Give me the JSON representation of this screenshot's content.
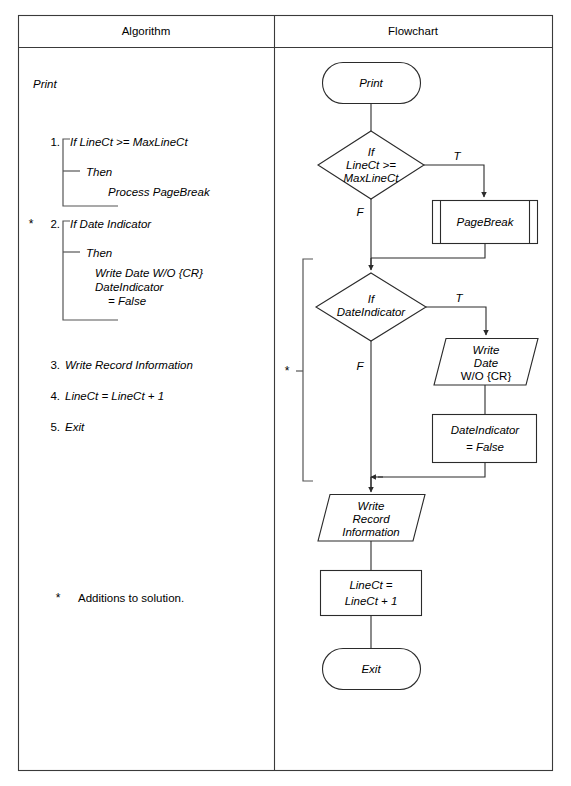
{
  "table": {
    "columns": [
      {
        "header": "Algorithm"
      },
      {
        "header": "Flowchart"
      }
    ]
  },
  "algorithm": {
    "title": "Print",
    "steps": [
      {
        "number": "1.",
        "marker": "",
        "condition": "If LineCt >= MaxLineCt",
        "then_label": "Then",
        "body": [
          "Process PageBreak"
        ]
      },
      {
        "number": "2.",
        "marker": "*",
        "condition": "If Date Indicator",
        "then_label": "Then",
        "body": [
          "Write Date W/O {CR}",
          "DateIndicator",
          "= False"
        ]
      },
      {
        "number": "3.",
        "marker": "",
        "condition": "Write Record Information",
        "then_label": "",
        "body": []
      },
      {
        "number": "4.",
        "marker": "",
        "condition": "LineCt = LineCt + 1",
        "then_label": "",
        "body": []
      },
      {
        "number": "5.",
        "marker": "",
        "condition": "Exit",
        "then_label": "",
        "body": []
      }
    ],
    "footnote_marker": "*",
    "footnote_text": "Additions to solution."
  },
  "flowchart": {
    "addition_marker": "*",
    "nodes": [
      {
        "id": "start",
        "shape": "terminator",
        "lines": [
          "Print"
        ]
      },
      {
        "id": "dec1",
        "shape": "decision",
        "lines": [
          "If",
          "LineCt >=",
          "MaxLineCt"
        ]
      },
      {
        "id": "pagebreak",
        "shape": "predefined-process",
        "lines": [
          "PageBreak"
        ]
      },
      {
        "id": "dec2",
        "shape": "decision",
        "lines": [
          "If",
          "DateIndicator"
        ]
      },
      {
        "id": "writedate",
        "shape": "data",
        "lines": [
          "Write",
          "Date",
          "W/O {CR}"
        ]
      },
      {
        "id": "setfalse",
        "shape": "process",
        "lines": [
          "DateIndicator",
          "= False"
        ]
      },
      {
        "id": "writerecord",
        "shape": "data",
        "lines": [
          "Write",
          "Record",
          "Information"
        ]
      },
      {
        "id": "inc",
        "shape": "process",
        "lines": [
          "LineCt =",
          "LineCt + 1"
        ]
      },
      {
        "id": "end",
        "shape": "terminator",
        "lines": [
          "Exit"
        ]
      }
    ],
    "branch_labels": {
      "dec1_true": "T",
      "dec1_false": "F",
      "dec2_true": "T",
      "dec2_false": "F"
    }
  },
  "colors": {
    "page_background": "#ffffff",
    "line": "#2b2b2b",
    "table_border": "#3a3a3a",
    "bracket": "#555555",
    "text": "#000000"
  }
}
